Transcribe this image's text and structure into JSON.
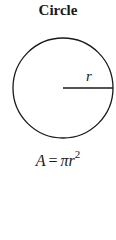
{
  "title": "Circle",
  "diagram": {
    "shape": "circle",
    "radius_label": "r",
    "stroke_color": "#1a1a1a"
  },
  "formula": {
    "lhs": "A",
    "eq": "=",
    "rhs_base": "πr",
    "exponent": "2",
    "full": "A = πr²"
  }
}
